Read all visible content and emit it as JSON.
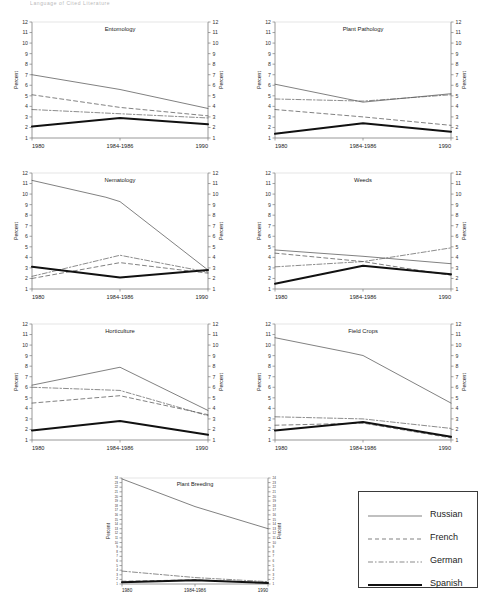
{
  "figure": {
    "title": "Language of Cited Literature",
    "x_categories": [
      "1980",
      "1984-1986",
      "1990"
    ],
    "y_axis_label": "Percent",
    "default_ylim": [
      1,
      12
    ],
    "default_yticks": [
      1,
      2,
      3,
      4,
      5,
      6,
      7,
      8,
      9,
      10,
      11,
      12
    ]
  },
  "legend": {
    "position": "bottom-right",
    "items": [
      {
        "label": "Russian",
        "style": "solid-thin"
      },
      {
        "label": "French",
        "style": "dashed"
      },
      {
        "label": "German",
        "style": "dash-dot"
      },
      {
        "label": "Spanish",
        "style": "solid-thick"
      }
    ]
  },
  "chart_data": [
    {
      "type": "line",
      "title": "Entomology",
      "xlabel": "",
      "ylabel": "Percent",
      "x": [
        "1980",
        "1984-1986",
        "1990"
      ],
      "ylim": [
        1,
        12
      ],
      "yticks": [
        1,
        2,
        3,
        4,
        5,
        6,
        7,
        8,
        9,
        10,
        11,
        12
      ],
      "grid": false,
      "series": [
        {
          "name": "Russian",
          "values": [
            7.0,
            5.6,
            3.8
          ]
        },
        {
          "name": "French",
          "values": [
            5.1,
            3.9,
            3.1
          ]
        },
        {
          "name": "German",
          "values": [
            3.7,
            3.3,
            2.9
          ]
        },
        {
          "name": "Spanish",
          "values": [
            2.1,
            2.9,
            2.3
          ]
        }
      ]
    },
    {
      "type": "line",
      "title": "Plant Pathology",
      "xlabel": "",
      "ylabel": "Percent",
      "x": [
        "1980",
        "1984-1986",
        "1990"
      ],
      "ylim": [
        1,
        12
      ],
      "yticks": [
        1,
        2,
        3,
        4,
        5,
        6,
        7,
        8,
        9,
        10,
        11,
        12
      ],
      "grid": false,
      "series": [
        {
          "name": "Russian",
          "values": [
            6.1,
            4.4,
            5.2
          ]
        },
        {
          "name": "French",
          "values": [
            3.7,
            3.0,
            2.2
          ]
        },
        {
          "name": "German",
          "values": [
            4.7,
            4.5,
            5.1
          ]
        },
        {
          "name": "Spanish",
          "values": [
            1.4,
            2.4,
            1.6
          ]
        }
      ]
    },
    {
      "type": "line",
      "title": "Nematology",
      "xlabel": "",
      "ylabel": "Percent",
      "x": [
        "1980",
        "1984-1986",
        "1990"
      ],
      "ylim": [
        1,
        12
      ],
      "yticks": [
        1,
        2,
        3,
        4,
        5,
        6,
        7,
        8,
        9,
        10,
        11,
        12
      ],
      "grid": false,
      "series": [
        {
          "name": "Russian",
          "values": [
            11.3,
            9.7,
            2.8
          ]
        },
        {
          "name": "French",
          "values": [
            2.0,
            3.5,
            2.5
          ]
        },
        {
          "name": "German",
          "values": [
            2.2,
            4.2,
            2.6
          ]
        },
        {
          "name": "Spanish",
          "values": [
            3.1,
            2.1,
            2.8
          ]
        }
      ]
    },
    {
      "type": "line",
      "title": "Weeds",
      "xlabel": "",
      "ylabel": "Percent",
      "x": [
        "1980",
        "1984-1986",
        "1990"
      ],
      "ylim": [
        1,
        12
      ],
      "yticks": [
        1,
        2,
        3,
        4,
        5,
        6,
        7,
        8,
        9,
        10,
        11,
        12
      ],
      "grid": false,
      "series": [
        {
          "name": "Russian",
          "values": [
            4.7,
            4.1,
            3.4
          ]
        },
        {
          "name": "French",
          "values": [
            4.4,
            3.6,
            2.3
          ]
        },
        {
          "name": "German",
          "values": [
            3.1,
            3.6,
            4.9
          ]
        },
        {
          "name": "Spanish",
          "values": [
            1.5,
            3.2,
            2.4
          ]
        }
      ]
    },
    {
      "type": "line",
      "title": "Horticulture",
      "xlabel": "",
      "ylabel": "Percent",
      "x": [
        "1980",
        "1984-1986",
        "1990"
      ],
      "ylim": [
        1,
        12
      ],
      "yticks": [
        1,
        2,
        3,
        4,
        5,
        6,
        7,
        8,
        9,
        10,
        11,
        12
      ],
      "grid": false,
      "series": [
        {
          "name": "Russian",
          "values": [
            6.2,
            7.9,
            3.8
          ]
        },
        {
          "name": "French",
          "values": [
            4.5,
            5.2,
            3.4
          ]
        },
        {
          "name": "German",
          "values": [
            6.0,
            5.7,
            3.3
          ]
        },
        {
          "name": "Spanish",
          "values": [
            1.9,
            2.8,
            1.5
          ]
        }
      ]
    },
    {
      "type": "line",
      "title": "Field Crops",
      "xlabel": "",
      "ylabel": "Percent",
      "x": [
        "1980",
        "1984-1986",
        "1990"
      ],
      "ylim": [
        1,
        12
      ],
      "yticks": [
        1,
        2,
        3,
        4,
        5,
        6,
        7,
        8,
        9,
        10,
        11,
        12
      ],
      "grid": false,
      "series": [
        {
          "name": "Russian",
          "values": [
            10.7,
            9.3,
            4.5
          ]
        },
        {
          "name": "French",
          "values": [
            2.4,
            2.6,
            1.2
          ]
        },
        {
          "name": "German",
          "values": [
            3.2,
            3.0,
            2.1
          ]
        },
        {
          "name": "Spanish",
          "values": [
            1.9,
            2.7,
            1.3
          ]
        }
      ]
    },
    {
      "type": "line",
      "title": "Plant Breeding",
      "xlabel": "",
      "ylabel": "Percent",
      "x": [
        "1980",
        "1984-1986",
        "1990"
      ],
      "ylim": [
        1,
        24
      ],
      "yticks": [
        1,
        2,
        3,
        4,
        5,
        6,
        7,
        8,
        9,
        10,
        11,
        12,
        13,
        14,
        15,
        16,
        17,
        18,
        19,
        20,
        21,
        22,
        23,
        24
      ],
      "grid": false,
      "series": [
        {
          "name": "Russian",
          "values": [
            23.8,
            17.8,
            13.0
          ]
        },
        {
          "name": "French",
          "values": [
            1.6,
            1.9,
            1.3
          ]
        },
        {
          "name": "German",
          "values": [
            3.8,
            2.4,
            1.5
          ]
        },
        {
          "name": "Spanish",
          "values": [
            1.4,
            1.8,
            1.2
          ]
        }
      ]
    }
  ]
}
